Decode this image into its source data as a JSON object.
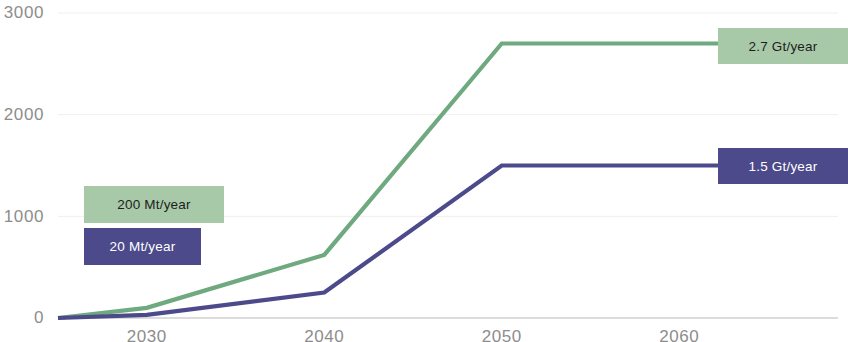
{
  "chart_data": {
    "type": "line",
    "title": "",
    "subtitle": "",
    "xlabel": "",
    "ylabel": "",
    "xlim": [
      2025,
      2065
    ],
    "ylim": [
      0,
      3000
    ],
    "xticks": [
      2030,
      2040,
      2050,
      2060
    ],
    "xtick_labels": [
      "2030",
      "2040",
      "2050",
      "2060"
    ],
    "yticks": [
      0,
      1000,
      2000,
      3000
    ],
    "ytick_labels": [
      "0",
      "1000",
      "2000",
      "3000"
    ],
    "grid": true,
    "grid_axis": "y",
    "legend": "none",
    "series": [
      {
        "name": "green-series",
        "color": "#6fa97f",
        "x": [
          2025,
          2030,
          2040,
          2050,
          2060,
          2065
        ],
        "values": [
          0,
          100,
          620,
          2700,
          2700,
          2700
        ]
      },
      {
        "name": "purple-series",
        "color": "#4c4a8a",
        "x": [
          2025,
          2030,
          2040,
          2050,
          2060,
          2065
        ],
        "values": [
          0,
          30,
          250,
          1500,
          1500,
          1500
        ]
      }
    ],
    "annotations": [
      {
        "name": "green-start-rate",
        "text": "200 Mt/year",
        "box_color": "#a8c9a8",
        "text_color": "#1d1d1d",
        "x": 84,
        "y": 186,
        "w": 140,
        "h": 37
      },
      {
        "name": "purple-start-rate",
        "text": "20 Mt/year",
        "box_color": "#4c4a8a",
        "text_color": "#ffffff",
        "x": 84,
        "y": 228,
        "w": 117,
        "h": 37
      },
      {
        "name": "green-end-rate",
        "text": "2.7 Gt/year",
        "box_color": "#a8c9a8",
        "text_color": "#1d1d1d",
        "x": 718,
        "y": 28,
        "w": 130,
        "h": 36
      },
      {
        "name": "purple-end-rate",
        "text": "1.5 Gt/year",
        "box_color": "#4c4a8a",
        "text_color": "#ffffff",
        "x": 718,
        "y": 148,
        "w": 130,
        "h": 36
      }
    ],
    "colors": {
      "green": "#6fa97f",
      "green_box": "#a8c9a8",
      "purple": "#4c4a8a",
      "grid": "#efefef",
      "axis": "#b9b9b9",
      "tick_text": "#8d8d8d"
    }
  }
}
